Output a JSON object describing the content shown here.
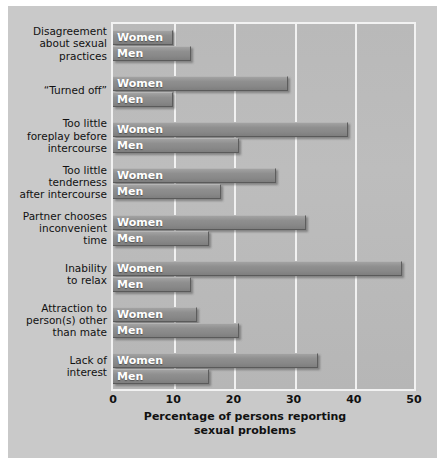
{
  "chart_data": {
    "type": "bar",
    "orientation": "horizontal",
    "title": "",
    "xlabel": "Percentage of persons reporting sexual problems",
    "ylabel": "",
    "xlim": [
      0,
      50
    ],
    "xticks": [
      0,
      10,
      20,
      30,
      40,
      50
    ],
    "xtick_labels": [
      "0",
      "10",
      "20",
      "30",
      "40",
      "50"
    ],
    "grid": true,
    "legend_position": "in-bar-labels",
    "series_names": [
      "Women",
      "Men"
    ],
    "categories": [
      "Disagreement about sexual practices",
      "“Turned off”",
      "Too little foreplay before intercourse",
      "Too little tenderness after intercourse",
      "Partner chooses inconvenient time",
      "Inability to relax",
      "Attraction to person(s) other than mate",
      "Lack of interest"
    ],
    "series": [
      {
        "name": "Women",
        "values": [
          10,
          29,
          39,
          27,
          32,
          48,
          14,
          34
        ]
      },
      {
        "name": "Men",
        "values": [
          13,
          10,
          21,
          18,
          16,
          13,
          21,
          16
        ]
      }
    ]
  },
  "axis": {
    "x_title_line1": "Percentage of persons reporting",
    "x_title_line2": "sexual problems",
    "ticks": [
      "0",
      "10",
      "20",
      "30",
      "40",
      "50"
    ]
  },
  "categories": [
    {
      "lines": [
        "Disagreement",
        "about sexual",
        "practices"
      ]
    },
    {
      "lines": [
        "“Turned off”"
      ]
    },
    {
      "lines": [
        "Too little",
        "foreplay before",
        "intercourse"
      ]
    },
    {
      "lines": [
        "Too little",
        "tenderness",
        "after intercourse"
      ]
    },
    {
      "lines": [
        "Partner chooses",
        "inconvenient",
        "time"
      ]
    },
    {
      "lines": [
        "Inability",
        "to relax"
      ]
    },
    {
      "lines": [
        "Attraction to",
        "person(s) other",
        "than mate"
      ]
    },
    {
      "lines": [
        "Lack of",
        "interest"
      ]
    }
  ],
  "bar_labels": {
    "women": "Women",
    "men": "Men"
  },
  "colors": {
    "bar_fill": "#8f8f8f",
    "plot_background": "#b9b9b9",
    "gridline": "#f1f1f1",
    "bar_label_text": "#ffffff",
    "axis_text": "#111111"
  }
}
